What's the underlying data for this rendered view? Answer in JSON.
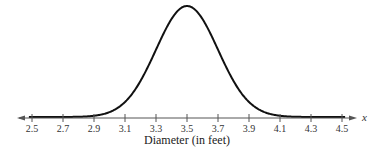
{
  "chart_data": {
    "type": "line",
    "title": "",
    "subtitle": "",
    "xlabel": "Diameter (in feet)",
    "ylabel": "",
    "x_variable": "x",
    "distribution": "normal",
    "mean": 3.5,
    "std_dev": 0.2,
    "xlim": [
      2.4,
      4.6
    ],
    "x_ticks": [
      2.5,
      2.7,
      2.9,
      3.1,
      3.3,
      3.5,
      3.7,
      3.9,
      4.1,
      4.3,
      4.5
    ],
    "x_tick_labels": [
      "2.5",
      "2.7",
      "2.9",
      "3.1",
      "3.3",
      "3.5",
      "3.7",
      "3.9",
      "4.1",
      "4.3",
      "4.5"
    ],
    "grid": false,
    "legend": null,
    "series": [
      {
        "name": "Normal curve",
        "x": [
          2.5,
          2.7,
          2.9,
          3.1,
          3.3,
          3.5,
          3.7,
          3.9,
          4.1,
          4.3,
          4.5
        ],
        "values": [
          0.0,
          0.0,
          0.02,
          0.27,
          1.21,
          1.99,
          1.21,
          0.27,
          0.02,
          0.0,
          0.0
        ]
      }
    ]
  },
  "colors": {
    "curve": "#111111",
    "axis": "#555555",
    "background": "#ffffff"
  }
}
